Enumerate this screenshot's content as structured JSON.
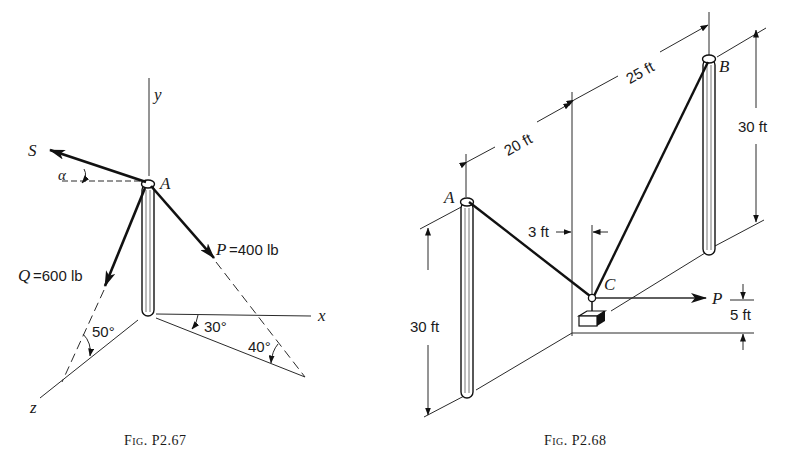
{
  "figures": [
    {
      "id": "fig_p2_67",
      "caption": "Fig. P2.67",
      "point_label": "A",
      "axes": {
        "x": "x",
        "y": "y",
        "z": "z"
      },
      "forces": {
        "S": {
          "label": "S",
          "angle_symbol": "α"
        },
        "P": {
          "label": "P = 400 lb",
          "magnitude": "400 lb"
        },
        "Q": {
          "label": "Q = 600 lb",
          "magnitude": "600 lb"
        }
      },
      "angles": {
        "a30": "30°",
        "a40": "40°",
        "a50": "50°"
      }
    },
    {
      "id": "fig_p2_68",
      "caption": "Fig. P2.68",
      "points": {
        "A": "A",
        "B": "B",
        "C": "C"
      },
      "force_label": "P",
      "dimensions": {
        "d20": "20 ft",
        "d25": "25 ft",
        "d3": "3 ft",
        "d5": "5 ft",
        "hA": "30 ft",
        "hB": "30 ft"
      }
    }
  ],
  "labels": {
    "f1": {
      "S": "S",
      "alpha": "α",
      "A": "A",
      "y": "y",
      "x": "x",
      "z": "z",
      "P": "P",
      "P_eq": "=400 lb",
      "Q": "Q",
      "Q_eq": "=600 lb",
      "a30": "30°",
      "a40": "40°",
      "a50": "50°",
      "caption": "Fig. P2.67"
    },
    "f2": {
      "A": "A",
      "B": "B",
      "C": "C",
      "P": "P",
      "d20": "20 ft",
      "d25": "25 ft",
      "d3": "3 ft",
      "d5": "5 ft",
      "hA": "30 ft",
      "hB": "30 ft",
      "caption": "Fig. P2.68"
    }
  },
  "colors": {
    "ink": "#111111",
    "paper": "#ffffff"
  }
}
